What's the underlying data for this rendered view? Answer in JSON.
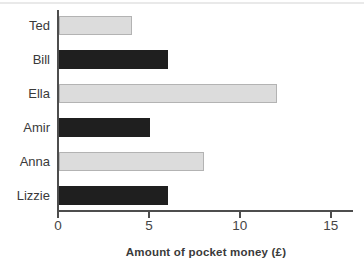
{
  "chart_data": {
    "type": "bar",
    "orientation": "horizontal",
    "categories": [
      "Ted",
      "Bill",
      "Ella",
      "Amir",
      "Anna",
      "Lizzie"
    ],
    "values": [
      4,
      6,
      12,
      5,
      8,
      6
    ],
    "bar_styles": [
      "light",
      "dark",
      "light",
      "dark",
      "light",
      "dark"
    ],
    "title": "",
    "xlabel": "Amount of pocket money (£)",
    "ylabel": "",
    "xlim": [
      0,
      16.2
    ],
    "xticks": [
      0,
      5,
      10,
      15
    ],
    "grid": false,
    "legend": "none"
  },
  "colors": {
    "light_bar": "#dcdcdc",
    "light_bar_border": "#b3b3b3",
    "dark_bar": "#1f1f1f",
    "axis": "#4d4d4d",
    "text": "#3a3a3a"
  }
}
